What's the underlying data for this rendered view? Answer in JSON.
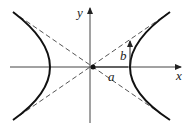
{
  "diagram": {
    "type": "hyperbola",
    "labels": {
      "x_axis": "x",
      "y_axis": "y",
      "semi_major": "a",
      "semi_minor": "b"
    },
    "colors": {
      "curve": "#111111",
      "axes": "#444444",
      "asymptotes": "#555555"
    },
    "elements": [
      "x-axis with arrow",
      "y-axis with arrow",
      "two hyperbola branches",
      "two dashed asymptotes",
      "origin point",
      "vertical arrow labeled b at right vertex",
      "segment labeled a from origin to right vertex"
    ]
  }
}
